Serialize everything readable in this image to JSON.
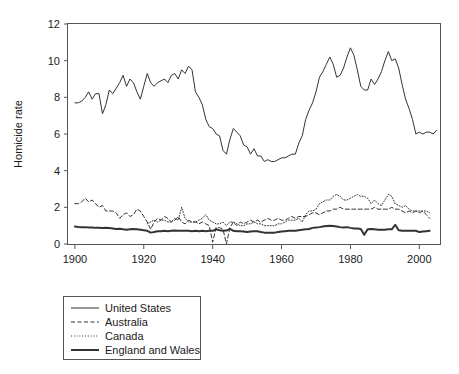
{
  "chart_data": {
    "type": "line",
    "title": "",
    "xlabel": "",
    "ylabel": "Homicide rate",
    "xlim": [
      1898,
      2006
    ],
    "ylim": [
      0,
      12
    ],
    "grid": false,
    "legend_position": "below-left",
    "xticks": [
      1900,
      1920,
      1940,
      1960,
      1980,
      2000
    ],
    "yticks": [
      0,
      2,
      4,
      6,
      8,
      10,
      12
    ],
    "xtick_labels": [
      "1900",
      "1920",
      "1940",
      "1960",
      "1980",
      "2000"
    ],
    "ytick_labels": [
      "0",
      "2",
      "4",
      "6",
      "8",
      "10",
      "12"
    ],
    "series": [
      {
        "name": "United States",
        "style": "solid",
        "width": 1,
        "color": "#333333",
        "x": [
          1900,
          1901,
          1902,
          1903,
          1904,
          1905,
          1906,
          1907,
          1908,
          1909,
          1910,
          1911,
          1912,
          1913,
          1914,
          1915,
          1916,
          1917,
          1918,
          1919,
          1920,
          1921,
          1922,
          1923,
          1924,
          1925,
          1926,
          1927,
          1928,
          1929,
          1930,
          1931,
          1932,
          1933,
          1934,
          1935,
          1936,
          1937,
          1938,
          1939,
          1940,
          1941,
          1942,
          1943,
          1944,
          1945,
          1946,
          1947,
          1948,
          1949,
          1950,
          1951,
          1952,
          1953,
          1954,
          1955,
          1956,
          1957,
          1958,
          1959,
          1960,
          1961,
          1962,
          1963,
          1964,
          1965,
          1966,
          1967,
          1968,
          1969,
          1970,
          1971,
          1972,
          1973,
          1974,
          1975,
          1976,
          1977,
          1978,
          1979,
          1980,
          1981,
          1982,
          1983,
          1984,
          1985,
          1986,
          1987,
          1988,
          1989,
          1990,
          1991,
          1992,
          1993,
          1994,
          1995,
          1996,
          1997,
          1998,
          1999,
          2000,
          2001,
          2002,
          2003,
          2004,
          2005
        ],
        "y": [
          7.7,
          7.7,
          7.8,
          8.0,
          8.3,
          7.9,
          8.2,
          8.2,
          7.1,
          7.6,
          8.4,
          8.2,
          8.5,
          8.8,
          9.2,
          8.6,
          9.0,
          8.8,
          8.3,
          7.9,
          8.6,
          9.3,
          8.8,
          8.6,
          8.8,
          8.9,
          9.0,
          8.8,
          9.2,
          9.3,
          9.0,
          9.5,
          9.3,
          9.7,
          9.5,
          8.3,
          8.0,
          7.6,
          6.8,
          6.4,
          6.3,
          6.0,
          5.9,
          5.1,
          4.9,
          5.7,
          6.3,
          6.1,
          5.9,
          5.4,
          5.3,
          4.9,
          5.2,
          4.8,
          4.8,
          4.5,
          4.6,
          4.5,
          4.5,
          4.6,
          4.7,
          4.7,
          4.8,
          4.9,
          4.9,
          5.5,
          5.9,
          6.8,
          7.3,
          7.7,
          8.3,
          9.1,
          9.4,
          9.8,
          10.2,
          9.8,
          9.1,
          9.2,
          9.6,
          10.2,
          10.7,
          10.3,
          9.5,
          8.6,
          8.4,
          8.4,
          9.0,
          8.7,
          9.0,
          9.4,
          10.0,
          10.5,
          10.0,
          10.1,
          9.6,
          8.7,
          7.9,
          7.4,
          6.8,
          6.0,
          6.1,
          6.0,
          6.1,
          6.1,
          6.0,
          6.2
        ]
      },
      {
        "name": "Australia",
        "style": "dashed",
        "width": 1,
        "color": "#333333",
        "x": [
          1900,
          1901,
          1902,
          1903,
          1904,
          1905,
          1906,
          1907,
          1908,
          1909,
          1910,
          1911,
          1912,
          1913,
          1914,
          1915,
          1916,
          1917,
          1918,
          1919,
          1920,
          1921,
          1922,
          1923,
          1924,
          1925,
          1926,
          1927,
          1928,
          1929,
          1930,
          1931,
          1932,
          1933,
          1934,
          1935,
          1936,
          1937,
          1938,
          1939,
          1940,
          1941,
          1942,
          1943,
          1944,
          1945,
          1946,
          1947,
          1948,
          1949,
          1950,
          1951,
          1952,
          1953,
          1954,
          1955,
          1956,
          1957,
          1958,
          1959,
          1960,
          1961,
          1962,
          1963,
          1964,
          1965,
          1966,
          1967,
          1968,
          1969,
          1970,
          1971,
          1972,
          1973,
          1974,
          1975,
          1976,
          1977,
          1978,
          1979,
          1980,
          1981,
          1982,
          1983,
          1984,
          1985,
          1986,
          1987,
          1988,
          1989,
          1990,
          1991,
          1992,
          1993,
          1994,
          1995,
          1996,
          1997,
          1998,
          1999,
          2000,
          2001,
          2002,
          2003
        ],
        "y": [
          2.2,
          2.2,
          2.3,
          2.5,
          2.3,
          2.4,
          2.2,
          2.0,
          2.1,
          1.8,
          1.8,
          1.8,
          1.7,
          1.4,
          1.6,
          1.7,
          1.5,
          1.6,
          1.9,
          1.8,
          1.5,
          1.2,
          0.8,
          1.2,
          1.4,
          1.3,
          1.5,
          1.4,
          1.2,
          1.3,
          1.5,
          1.2,
          1.1,
          1.3,
          1.2,
          1.2,
          1.1,
          1.2,
          1.1,
          1.0,
          0.1,
          0.9,
          0.9,
          0.8,
          0.0,
          0.9,
          1.2,
          1.0,
          1.2,
          1.1,
          1.2,
          1.3,
          1.2,
          1.3,
          1.2,
          1.3,
          1.4,
          1.3,
          1.3,
          1.4,
          1.3,
          1.3,
          1.4,
          1.5,
          1.4,
          1.5,
          1.5,
          1.5,
          1.6,
          1.7,
          1.7,
          1.6,
          1.7,
          1.8,
          1.8,
          1.9,
          1.9,
          2.0,
          1.9,
          1.9,
          1.9,
          1.9,
          1.9,
          1.9,
          1.9,
          1.9,
          1.9,
          2.0,
          1.9,
          1.9,
          1.9,
          1.9,
          2.0,
          1.9,
          1.9,
          1.8,
          1.7,
          1.8,
          1.7,
          1.8,
          1.7,
          1.8,
          1.6,
          1.4
        ]
      },
      {
        "name": "Canada",
        "style": "dotted",
        "width": 1,
        "color": "#333333",
        "x": [
          1921,
          1922,
          1923,
          1924,
          1925,
          1926,
          1927,
          1928,
          1929,
          1930,
          1931,
          1932,
          1933,
          1934,
          1935,
          1936,
          1937,
          1938,
          1939,
          1940,
          1941,
          1942,
          1943,
          1944,
          1945,
          1946,
          1947,
          1948,
          1949,
          1950,
          1951,
          1952,
          1953,
          1954,
          1955,
          1956,
          1957,
          1958,
          1959,
          1960,
          1961,
          1962,
          1963,
          1964,
          1965,
          1966,
          1967,
          1968,
          1969,
          1970,
          1971,
          1972,
          1973,
          1974,
          1975,
          1976,
          1977,
          1978,
          1979,
          1980,
          1981,
          1982,
          1983,
          1984,
          1985,
          1986,
          1987,
          1988,
          1989,
          1990,
          1991,
          1992,
          1993,
          1994,
          1995,
          1996,
          1997,
          1998,
          1999,
          2000,
          2001,
          2002,
          2003
        ],
        "y": [
          1.1,
          1.2,
          1.3,
          1.2,
          1.3,
          1.3,
          1.2,
          1.2,
          1.4,
          1.3,
          2.0,
          1.4,
          1.2,
          1.2,
          1.2,
          1.3,
          1.4,
          1.6,
          1.3,
          1.2,
          1.1,
          1.1,
          1.2,
          1.0,
          1.2,
          1.2,
          1.1,
          1.0,
          1.0,
          1.1,
          1.1,
          1.2,
          1.1,
          1.1,
          1.0,
          1.0,
          1.0,
          1.0,
          1.1,
          1.1,
          1.2,
          1.3,
          1.3,
          1.3,
          1.4,
          1.2,
          1.6,
          1.8,
          1.8,
          1.9,
          2.2,
          2.3,
          2.4,
          2.4,
          2.6,
          2.7,
          2.6,
          2.4,
          2.4,
          2.5,
          2.6,
          2.7,
          2.6,
          2.6,
          2.5,
          2.2,
          2.4,
          2.2,
          2.1,
          2.4,
          2.7,
          2.6,
          2.2,
          2.1,
          2.0,
          2.1,
          1.9,
          1.8,
          1.8,
          1.8,
          1.8,
          1.8,
          1.7
        ]
      },
      {
        "name": "England and Wales",
        "style": "solid",
        "width": 2,
        "color": "#222222",
        "x": [
          1900,
          1901,
          1902,
          1903,
          1904,
          1905,
          1906,
          1907,
          1908,
          1909,
          1910,
          1911,
          1912,
          1913,
          1914,
          1915,
          1916,
          1917,
          1918,
          1919,
          1920,
          1921,
          1922,
          1923,
          1924,
          1925,
          1926,
          1927,
          1928,
          1929,
          1930,
          1931,
          1932,
          1933,
          1934,
          1935,
          1936,
          1937,
          1938,
          1939,
          1940,
          1941,
          1942,
          1943,
          1944,
          1945,
          1946,
          1947,
          1948,
          1949,
          1950,
          1951,
          1952,
          1953,
          1954,
          1955,
          1956,
          1957,
          1958,
          1959,
          1960,
          1961,
          1962,
          1963,
          1964,
          1965,
          1966,
          1967,
          1968,
          1969,
          1970,
          1971,
          1972,
          1973,
          1974,
          1975,
          1976,
          1977,
          1978,
          1979,
          1980,
          1981,
          1982,
          1983,
          1984,
          1985,
          1986,
          1987,
          1988,
          1989,
          1990,
          1991,
          1992,
          1993,
          1994,
          1995,
          1996,
          1997,
          1998,
          1999,
          2000,
          2001,
          2002,
          2003
        ],
        "y": [
          0.95,
          0.93,
          0.92,
          0.92,
          0.9,
          0.9,
          0.88,
          0.88,
          0.87,
          0.88,
          0.87,
          0.85,
          0.82,
          0.83,
          0.8,
          0.78,
          0.8,
          0.82,
          0.8,
          0.78,
          0.75,
          0.72,
          0.62,
          0.65,
          0.7,
          0.7,
          0.72,
          0.7,
          0.72,
          0.73,
          0.72,
          0.72,
          0.72,
          0.72,
          0.7,
          0.72,
          0.7,
          0.72,
          0.7,
          0.72,
          0.72,
          0.8,
          0.75,
          0.72,
          0.73,
          0.82,
          0.72,
          0.7,
          0.7,
          0.68,
          0.65,
          0.68,
          0.7,
          0.7,
          0.65,
          0.62,
          0.62,
          0.62,
          0.62,
          0.65,
          0.68,
          0.7,
          0.72,
          0.72,
          0.72,
          0.75,
          0.78,
          0.8,
          0.82,
          0.88,
          0.9,
          0.92,
          0.95,
          0.98,
          1.0,
          0.98,
          0.95,
          0.92,
          0.9,
          0.92,
          0.88,
          0.85,
          0.85,
          0.82,
          0.5,
          0.8,
          0.82,
          0.8,
          0.78,
          0.78,
          0.78,
          0.8,
          0.8,
          1.05,
          0.75,
          0.72,
          0.72,
          0.72,
          0.72,
          0.72,
          0.65,
          0.68,
          0.7,
          0.72
        ]
      }
    ]
  },
  "legend": {
    "items": [
      {
        "label": "United States",
        "style": "solid",
        "width": 1
      },
      {
        "label": "Australia",
        "style": "dashed",
        "width": 1
      },
      {
        "label": "Canada",
        "style": "dotted",
        "width": 1
      },
      {
        "label": "England and Wales",
        "style": "solid",
        "width": 2
      }
    ]
  }
}
